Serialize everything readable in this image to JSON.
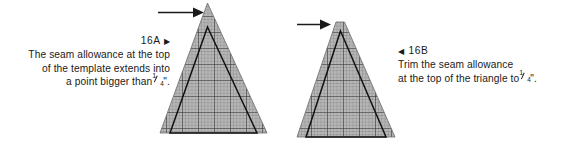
{
  "figure": {
    "background_color": "#ffffff",
    "ink_color": "#1a1a1a",
    "grid_fill_color": "#b5b5b5",
    "grid_line_color": "#6e6e6e",
    "grid_major_line_color": "#3d3d3d"
  },
  "panels": [
    {
      "id": "16A",
      "label": "16A",
      "marker_icon": "triangle-right-icon",
      "marker_glyph": "▶",
      "marker_side": "right",
      "caption_lines": [
        "The seam allowance at the top",
        "of the template extends into",
        "a point bigger than"
      ],
      "caption_tail": ".",
      "fraction": {
        "numerator": "1",
        "denominator": "4",
        "unit": "\""
      },
      "arrow_icon": "arrow-right-icon",
      "diagram": {
        "name": "triangle-with-pointed-seam-allowance",
        "outer_shape": "shaded-grid-triangle-sharp-apex",
        "inner_shape": "finished-triangle-outline"
      }
    },
    {
      "id": "16B",
      "label": "16B",
      "marker_icon": "triangle-left-icon",
      "marker_glyph": "◀",
      "marker_side": "left",
      "caption_lines": [
        "Trim the seam allowance",
        "at the top of the triangle to"
      ],
      "caption_tail": ".",
      "fraction": {
        "numerator": "1",
        "denominator": "4",
        "unit": "\""
      },
      "arrow_icon": "arrow-right-icon",
      "diagram": {
        "name": "triangle-with-trimmed-seam-allowance",
        "outer_shape": "shaded-grid-triangle-blunt-apex",
        "inner_shape": "finished-triangle-outline"
      }
    }
  ]
}
